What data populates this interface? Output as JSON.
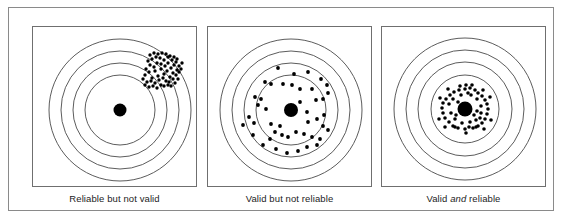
{
  "figure": {
    "background_color": "#ffffff",
    "frame_color": "#8a8a8a",
    "ring_color": "#4a4a4a",
    "shot_color": "#000000"
  },
  "panels": [
    {
      "id": "reliable-not-valid",
      "caption_prefix": "Reliable but not valid",
      "caption_em": "",
      "caption_suffix": "",
      "target": {
        "center": [
          87,
          83
        ],
        "ring_radii": [
          71,
          59,
          47,
          35
        ],
        "bullseye_radius": 6.5,
        "shot_radius": 1.7,
        "pattern": "tight-cluster-off-center",
        "cluster_center": [
          125,
          40
        ],
        "shots": [
          [
            112,
            48
          ],
          [
            116,
            45
          ],
          [
            119,
            51
          ],
          [
            122,
            44
          ],
          [
            125,
            49
          ],
          [
            128,
            42
          ],
          [
            131,
            47
          ],
          [
            134,
            44
          ],
          [
            137,
            50
          ],
          [
            140,
            46
          ],
          [
            113,
            42
          ],
          [
            117,
            38
          ],
          [
            121,
            40
          ],
          [
            124,
            36
          ],
          [
            128,
            37
          ],
          [
            132,
            39
          ],
          [
            135,
            36
          ],
          [
            138,
            41
          ],
          [
            141,
            38
          ],
          [
            144,
            43
          ],
          [
            115,
            34
          ],
          [
            119,
            32
          ],
          [
            123,
            30
          ],
          [
            127,
            31
          ],
          [
            131,
            33
          ],
          [
            135,
            30
          ],
          [
            139,
            33
          ],
          [
            143,
            35
          ],
          [
            146,
            39
          ],
          [
            110,
            52
          ],
          [
            114,
            55
          ],
          [
            118,
            54
          ],
          [
            122,
            56
          ],
          [
            126,
            53
          ],
          [
            130,
            51
          ],
          [
            133,
            54
          ],
          [
            136,
            55
          ],
          [
            140,
            52
          ],
          [
            143,
            48
          ],
          [
            146,
            45
          ],
          [
            117,
            28
          ],
          [
            121,
            26
          ],
          [
            125,
            27
          ],
          [
            129,
            26
          ],
          [
            133,
            27
          ],
          [
            137,
            29
          ],
          [
            141,
            30
          ],
          [
            144,
            32
          ],
          [
            112,
            58
          ],
          [
            116,
            60
          ],
          [
            120,
            59
          ],
          [
            124,
            61
          ],
          [
            128,
            58
          ],
          [
            131,
            59
          ],
          [
            135,
            58
          ],
          [
            138,
            59
          ],
          [
            142,
            56
          ],
          [
            145,
            52
          ],
          [
            148,
            42
          ],
          [
            149,
            36
          ]
        ]
      }
    },
    {
      "id": "valid-not-reliable",
      "caption_prefix": "Valid but not reliable",
      "caption_em": "",
      "caption_suffix": "",
      "target": {
        "center": [
          83,
          83
        ],
        "ring_radii": [
          71,
          59,
          47,
          35
        ],
        "bullseye_radius": 7,
        "shot_radius": 1.9,
        "pattern": "scattered-around-center",
        "shots": [
          [
            70,
            41
          ],
          [
            86,
            47
          ],
          [
            100,
            45
          ],
          [
            113,
            52
          ],
          [
            119,
            58
          ],
          [
            63,
            57
          ],
          [
            57,
            55
          ],
          [
            75,
            57
          ],
          [
            92,
            62
          ],
          [
            104,
            62
          ],
          [
            120,
            66
          ],
          [
            115,
            72
          ],
          [
            47,
            70
          ],
          [
            53,
            72
          ],
          [
            50,
            78
          ],
          [
            58,
            82
          ],
          [
            41,
            90
          ],
          [
            35,
            98
          ],
          [
            46,
            96
          ],
          [
            63,
            97
          ],
          [
            72,
            99
          ],
          [
            92,
            75
          ],
          [
            99,
            85
          ],
          [
            100,
            95
          ],
          [
            109,
            92
          ],
          [
            115,
            99
          ],
          [
            120,
            103
          ],
          [
            67,
            105
          ],
          [
            74,
            108
          ],
          [
            62,
            112
          ],
          [
            80,
            110
          ],
          [
            88,
            105
          ],
          [
            96,
            107
          ],
          [
            104,
            110
          ],
          [
            112,
            112
          ],
          [
            55,
            118
          ],
          [
            68,
            122
          ],
          [
            79,
            126
          ],
          [
            90,
            124
          ],
          [
            99,
            120
          ],
          [
            109,
            118
          ],
          [
            116,
            88
          ],
          [
            45,
            108
          ],
          [
            108,
            73
          ],
          [
            84,
            58
          ]
        ]
      }
    },
    {
      "id": "valid-and-reliable",
      "caption_prefix": "Valid ",
      "caption_em": "and",
      "caption_suffix": " reliable",
      "target": {
        "center": [
          83,
          82
        ],
        "ring_radii": [
          71,
          59,
          47,
          34
        ],
        "bullseye_radius": 7.5,
        "shot_radius": 1.8,
        "pattern": "tight-cluster-on-center",
        "shots": [
          [
            83,
            62
          ],
          [
            88,
            61
          ],
          [
            93,
            63
          ],
          [
            77,
            63
          ],
          [
            72,
            65
          ],
          [
            68,
            68
          ],
          [
            96,
            66
          ],
          [
            100,
            69
          ],
          [
            64,
            72
          ],
          [
            103,
            73
          ],
          [
            61,
            76
          ],
          [
            105,
            77
          ],
          [
            60,
            81
          ],
          [
            106,
            82
          ],
          [
            61,
            86
          ],
          [
            105,
            87
          ],
          [
            63,
            91
          ],
          [
            103,
            92
          ],
          [
            67,
            95
          ],
          [
            100,
            96
          ],
          [
            71,
            99
          ],
          [
            96,
            99
          ],
          [
            76,
            101
          ],
          [
            91,
            101
          ],
          [
            83,
            102
          ],
          [
            87,
            100
          ],
          [
            79,
            68
          ],
          [
            89,
            68
          ],
          [
            95,
            72
          ],
          [
            71,
            72
          ],
          [
            67,
            77
          ],
          [
            99,
            79
          ],
          [
            99,
            86
          ],
          [
            69,
            86
          ],
          [
            73,
            92
          ],
          [
            94,
            93
          ],
          [
            80,
            96
          ],
          [
            88,
            95
          ],
          [
            86,
            66
          ],
          [
            76,
            75
          ],
          [
            94,
            100
          ],
          [
            73,
            100
          ],
          [
            84,
            58
          ],
          [
            90,
            58
          ],
          [
            78,
            59
          ],
          [
            58,
            71
          ],
          [
            108,
            70
          ],
          [
            57,
            92
          ],
          [
            109,
            93
          ],
          [
            84,
            106
          ],
          [
            92,
            88
          ],
          [
            74,
            88
          ],
          [
            66,
            62
          ],
          [
            101,
            63
          ],
          [
            63,
            100
          ],
          [
            102,
            102
          ],
          [
            95,
            84
          ],
          [
            98,
            91
          ]
        ]
      }
    }
  ]
}
